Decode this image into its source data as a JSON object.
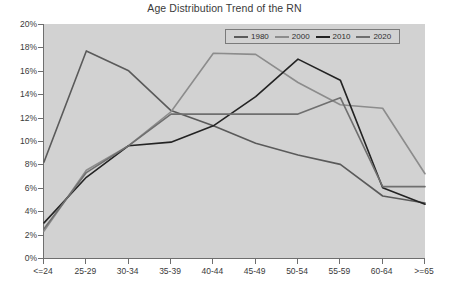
{
  "chart": {
    "title": "Age Distribution Trend of the RN"
  },
  "legend": {
    "position": "top-right",
    "entries": [
      {
        "label": "1980",
        "color": "#5a5a5a"
      },
      {
        "label": "2000",
        "color": "#8c8c8c"
      },
      {
        "label": "2010",
        "color": "#232323"
      },
      {
        "label": "2020",
        "color": "#6f6f6f"
      }
    ]
  },
  "axes": {
    "y_ticks": [
      "0%",
      "2%",
      "4%",
      "6%",
      "8%",
      "10%",
      "12%",
      "14%",
      "16%",
      "18%",
      "20%"
    ],
    "x_ticks": [
      "<=24",
      "25-29",
      "30-34",
      "35-39",
      "40-44",
      "45-49",
      "50-54",
      "55-59",
      "60-64",
      ">=65"
    ]
  },
  "chart_data": {
    "type": "line",
    "title": "Age Distribution Trend of the RN",
    "xlabel": "",
    "ylabel": "",
    "ylim": [
      0,
      20
    ],
    "ytick_step": 2,
    "yunit": "%",
    "grid": false,
    "legend_position": "top-right",
    "categories": [
      "<=24",
      "25-29",
      "30-34",
      "35-39",
      "40-44",
      "45-49",
      "50-54",
      "55-59",
      "60-64",
      ">=65"
    ],
    "series": [
      {
        "name": "1980",
        "color": "#5a5a5a",
        "values": [
          8.2,
          17.7,
          16.0,
          12.6,
          11.3,
          9.8,
          8.8,
          8.0,
          5.3,
          4.7
        ]
      },
      {
        "name": "2000",
        "color": "#8c8c8c",
        "values": [
          2.3,
          7.5,
          9.6,
          12.5,
          17.5,
          17.4,
          15.0,
          13.1,
          12.8,
          7.2
        ]
      },
      {
        "name": "2010",
        "color": "#232323",
        "values": [
          3.0,
          6.9,
          9.6,
          9.9,
          11.3,
          13.8,
          17.0,
          15.2,
          6.0,
          4.6
        ]
      },
      {
        "name": "2020",
        "color": "#6f6f6f",
        "values": [
          2.5,
          7.3,
          9.6,
          12.3,
          12.3,
          12.3,
          12.3,
          13.7,
          6.1,
          6.1
        ]
      }
    ]
  }
}
